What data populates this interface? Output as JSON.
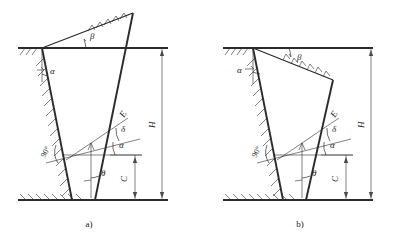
{
  "figure": {
    "background_color": "#ffffff",
    "line_color": "#2b2b2b",
    "width": 405,
    "height": 243
  },
  "panels": [
    {
      "id": "a",
      "caption": "a)",
      "description": "Backfill surface inclined upward away from the wall (positive beta)",
      "labels": {
        "beta": "β",
        "alpha_top": "α",
        "alpha_mid": "α",
        "delta": "δ",
        "theta": "θ",
        "right_angle": "90°",
        "force": "E",
        "height": "H",
        "depth": "C"
      }
    },
    {
      "id": "b",
      "caption": "b)",
      "description": "Backfill surface inclined downward away from the wall (negative beta)",
      "labels": {
        "beta": "β",
        "alpha_top": "α",
        "alpha_mid": "α",
        "delta": "δ",
        "theta": "θ",
        "right_angle": "90°",
        "force": "E",
        "height": "H",
        "depth": "C"
      }
    }
  ],
  "symbols": {
    "beta": "β",
    "alpha": "α",
    "delta": "δ",
    "theta": "θ",
    "right_angle": "90°",
    "resultant_force": "E",
    "total_height": "H",
    "lower_height": "C"
  },
  "captions": {
    "panel_a": "a)",
    "panel_b": "b)"
  }
}
